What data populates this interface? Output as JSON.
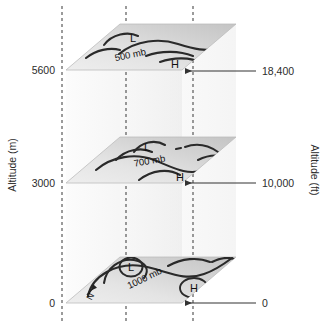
{
  "figure": {
    "type": "3d-isobaric-surface-diagram"
  },
  "axes": {
    "left": {
      "title": "Altitude (m)",
      "ticks": [
        {
          "label": "5600",
          "value": 5600
        },
        {
          "label": "3000",
          "value": 3000
        },
        {
          "label": "0",
          "value": 0
        }
      ]
    },
    "right": {
      "title": "Altitude (ft)",
      "ticks": [
        {
          "label": "18,400",
          "value": 18400
        },
        {
          "label": "10,000",
          "value": 10000
        },
        {
          "label": "0",
          "value": 0
        }
      ]
    }
  },
  "planes": [
    {
      "id": "plane-500mb",
      "pressure_label": "500 mb",
      "altitude_m": 5600,
      "altitude_ft": 18400,
      "low_label": "L",
      "high_label": "H",
      "low_circled": false,
      "high_circled": false
    },
    {
      "id": "plane-700mb",
      "pressure_label": "700 mb",
      "altitude_m": 3000,
      "altitude_ft": 10000,
      "low_label": "L",
      "high_label": "H",
      "low_circled": false,
      "high_circled": false
    },
    {
      "id": "plane-1000mb",
      "pressure_label": "1000 mb",
      "altitude_m": 0,
      "altitude_ft": 0,
      "low_label": "L",
      "high_label": "H",
      "low_circled": true,
      "high_circled": true
    }
  ],
  "compass": {
    "label": "N"
  },
  "colors": {
    "plane_fill_light": "#f2f2f2",
    "plane_fill_dark": "#c8c8c8",
    "contour_stroke": "#2a2a2a",
    "dashed_guide": "#4a4a4a",
    "arrow": "#333333",
    "text": "#2b2b2b",
    "background": "#ffffff"
  }
}
